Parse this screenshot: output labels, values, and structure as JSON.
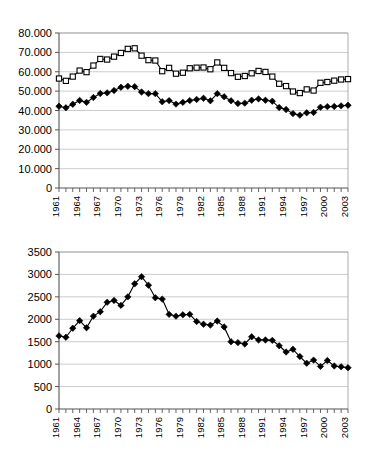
{
  "chart_data": [
    {
      "id": "chart-top",
      "type": "line",
      "title": "",
      "xlabel": "",
      "ylabel": "",
      "grid": true,
      "legend": "none",
      "ylim": [
        0,
        80000
      ],
      "yticks": [
        0,
        10000,
        20000,
        30000,
        40000,
        50000,
        60000,
        70000,
        80000
      ],
      "ytick_labels": [
        "0",
        "10.000",
        "20.000",
        "30.000",
        "40.000",
        "50.000",
        "60.000",
        "70.000",
        "80.000"
      ],
      "x": [
        1961,
        1962,
        1963,
        1964,
        1965,
        1966,
        1967,
        1968,
        1969,
        1970,
        1971,
        1972,
        1973,
        1974,
        1975,
        1976,
        1977,
        1978,
        1979,
        1980,
        1981,
        1982,
        1983,
        1984,
        1985,
        1986,
        1987,
        1988,
        1989,
        1990,
        1991,
        1992,
        1993,
        1994,
        1995,
        1996,
        1997,
        1998,
        1999,
        2000,
        2001,
        2002,
        2003
      ],
      "xtick_labels": [
        "1961",
        "1964",
        "1967",
        "1970",
        "1973",
        "1976",
        "1979",
        "1982",
        "1985",
        "1988",
        "1991",
        "1994",
        "1997",
        "2000",
        "2003"
      ],
      "xtick_step": 3,
      "series": [
        {
          "name": "open-square-series",
          "marker": "open-square",
          "values": [
            56500,
            55300,
            57500,
            60600,
            59800,
            63200,
            66600,
            66300,
            67800,
            69700,
            71800,
            72100,
            68300,
            66000,
            65800,
            60300,
            62000,
            59000,
            59500,
            61800,
            62100,
            62200,
            61300,
            64800,
            62000,
            59300,
            57400,
            57800,
            59200,
            60400,
            59900,
            57500,
            53800,
            52600,
            49800,
            49000,
            50900,
            50300,
            54300,
            54700,
            55400,
            56000,
            56200
          ]
        },
        {
          "name": "filled-diamond-series",
          "marker": "filled-diamond",
          "values": [
            42200,
            41400,
            43200,
            45200,
            44200,
            46700,
            48800,
            49100,
            50300,
            52000,
            52500,
            52300,
            49500,
            48700,
            48700,
            44500,
            45100,
            43300,
            44200,
            45100,
            45700,
            46300,
            45000,
            48700,
            47100,
            45000,
            43600,
            43800,
            45300,
            46000,
            45300,
            44800,
            41500,
            40500,
            38400,
            37600,
            38800,
            39000,
            41700,
            42000,
            42100,
            42400,
            42700
          ]
        }
      ]
    },
    {
      "id": "chart-bottom",
      "type": "line",
      "title": "",
      "xlabel": "",
      "ylabel": "",
      "grid": true,
      "legend": "none",
      "ylim": [
        0,
        3500
      ],
      "yticks": [
        0,
        500,
        1000,
        1500,
        2000,
        2500,
        3000,
        3500
      ],
      "ytick_labels": [
        "0",
        "500",
        "1000",
        "1500",
        "2000",
        "2500",
        "3000",
        "3500"
      ],
      "x": [
        1961,
        1962,
        1963,
        1964,
        1965,
        1966,
        1967,
        1968,
        1969,
        1970,
        1971,
        1972,
        1973,
        1974,
        1975,
        1976,
        1977,
        1978,
        1979,
        1980,
        1981,
        1982,
        1983,
        1984,
        1985,
        1986,
        1987,
        1988,
        1989,
        1990,
        1991,
        1992,
        1993,
        1994,
        1995,
        1996,
        1997,
        1998,
        1999,
        2000,
        2001,
        2002,
        2003
      ],
      "xtick_labels": [
        "1961",
        "1964",
        "1967",
        "1970",
        "1973",
        "1976",
        "1979",
        "1982",
        "1985",
        "1988",
        "1991",
        "1994",
        "1997",
        "2000",
        "2003"
      ],
      "xtick_step": 3,
      "series": [
        {
          "name": "filled-diamond-series",
          "marker": "filled-diamond",
          "values": [
            1630,
            1600,
            1800,
            1970,
            1810,
            2070,
            2170,
            2380,
            2420,
            2310,
            2500,
            2790,
            2950,
            2760,
            2480,
            2450,
            2110,
            2070,
            2100,
            2110,
            1950,
            1890,
            1870,
            1960,
            1830,
            1500,
            1480,
            1450,
            1610,
            1540,
            1540,
            1530,
            1410,
            1270,
            1330,
            1170,
            1020,
            1090,
            950,
            1080,
            960,
            940,
            920
          ]
        }
      ]
    }
  ]
}
